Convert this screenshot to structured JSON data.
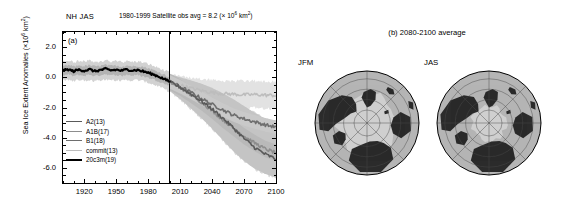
{
  "figure": {
    "panel_a_tag": "(a)",
    "panel_b_title": "(b) 2080-2100 average",
    "header_region_season": "NH JAS",
    "header_obs": "1980-1999 Satellite obs avg = 8.2 (× 10⁶ km²)",
    "header_obs_pre": "1980-1999 Satellite obs avg = 8.2 (× 10",
    "header_obs_sup": "6",
    "header_obs_post": " km",
    "header_obs_sup2": "2",
    "header_obs_close": ")"
  },
  "axes": {
    "ylabel_pre": "Sea Ice Extent Anomalies (×10",
    "ylabel_sup": "6",
    "ylabel_mid": " km",
    "ylabel_sup2": "2",
    "ylabel_post": ")",
    "ylabel_full": "Sea Ice Extent Anomalies (×10⁶ km²)",
    "yticks": [
      "2.0",
      "0.0",
      "-2.0",
      "-4.0",
      "-6.0"
    ],
    "ytick_values": [
      2.0,
      0.0,
      -2.0,
      -4.0,
      -6.0
    ],
    "ylim": [
      -7.0,
      3.0
    ],
    "xticks": [
      "1920",
      "1950",
      "1980",
      "2010",
      "2040",
      "2070",
      "2100"
    ],
    "xtick_values": [
      1920,
      1950,
      1980,
      2010,
      2040,
      2070,
      2100
    ],
    "xlim": [
      1900,
      2100
    ],
    "minor_tick_interval": 10,
    "divider_year": 2000
  },
  "legend": {
    "entries": [
      {
        "label": "A2(13)",
        "color": "#5a5a5a",
        "width": 1.6
      },
      {
        "label": "A1B(17)",
        "color": "#8d8d8d",
        "width": 1.6
      },
      {
        "label": "B1(18)",
        "color": "#6e6e6e",
        "width": 1.6
      },
      {
        "label": "commit(13)",
        "color": "#bdbdbd",
        "width": 1.6
      },
      {
        "label": "20c3m(19)",
        "color": "#000000",
        "width": 2.2
      }
    ]
  },
  "maps": {
    "items": [
      {
        "label": "JFM",
        "name": "map-jfm",
        "ice_extent": 0.93
      },
      {
        "label": "JAS",
        "name": "map-jas",
        "ice_extent": 0.42
      }
    ],
    "land_color": "#2b2b2b",
    "ocean_color": "#b5b5b5",
    "ice_color": "#cfcfcf",
    "graticule_color": "#4a4a4a",
    "circles": [
      0.25,
      0.45,
      0.65,
      0.85,
      1.0
    ]
  },
  "chart_data": {
    "type": "line",
    "xlabel": "",
    "ylabel": "Sea Ice Extent Anomalies (×10⁶ km²)",
    "xlim": [
      1900,
      2100
    ],
    "ylim": [
      -7.0,
      3.0
    ],
    "grid": false,
    "legend_position": "lower-left",
    "annotations": [
      {
        "text": "NH JAS",
        "x": 1903,
        "y": 3.35
      },
      {
        "text": "1980-1999 Satellite obs avg = 8.2 (× 10⁶ km²)",
        "x": 2000,
        "y": 3.35
      },
      {
        "text": "(a)",
        "x": 1906,
        "y": 2.6
      }
    ],
    "vertical_line": {
      "x": 2000,
      "color": "#000000",
      "width": 1
    },
    "series": [
      {
        "name": "20c3m(19)",
        "color": "#000000",
        "width": 2.2,
        "x": [
          1900,
          1905,
          1910,
          1915,
          1920,
          1925,
          1930,
          1935,
          1940,
          1945,
          1950,
          1955,
          1960,
          1965,
          1970,
          1975,
          1980,
          1985,
          1990,
          1995,
          2000
        ],
        "values": [
          0.45,
          0.52,
          0.4,
          0.5,
          0.44,
          0.52,
          0.4,
          0.48,
          0.55,
          0.46,
          0.5,
          0.44,
          0.52,
          0.46,
          0.48,
          0.4,
          0.3,
          0.18,
          0.05,
          -0.12,
          -0.28
        ],
        "band_outer": [
          [
            1.05,
            -0.2
          ],
          [
            1.1,
            -0.15
          ],
          [
            1.0,
            -0.25
          ],
          [
            1.08,
            -0.18
          ],
          [
            1.02,
            -0.22
          ],
          [
            1.1,
            -0.15
          ],
          [
            1.0,
            -0.25
          ],
          [
            1.05,
            -0.18
          ],
          [
            1.12,
            -0.12
          ],
          [
            1.04,
            -0.2
          ],
          [
            1.08,
            -0.18
          ],
          [
            1.0,
            -0.24
          ],
          [
            1.08,
            -0.16
          ],
          [
            1.02,
            -0.22
          ],
          [
            1.05,
            -0.18
          ],
          [
            0.98,
            -0.25
          ],
          [
            0.88,
            -0.35
          ],
          [
            0.75,
            -0.48
          ],
          [
            0.62,
            -0.6
          ],
          [
            0.45,
            -0.78
          ],
          [
            0.3,
            -0.95
          ]
        ],
        "band_inner": [
          [
            0.75,
            0.12
          ],
          [
            0.8,
            0.18
          ],
          [
            0.72,
            0.08
          ],
          [
            0.78,
            0.16
          ],
          [
            0.74,
            0.1
          ],
          [
            0.8,
            0.18
          ],
          [
            0.72,
            0.08
          ],
          [
            0.76,
            0.15
          ],
          [
            0.82,
            0.22
          ],
          [
            0.75,
            0.12
          ],
          [
            0.78,
            0.16
          ],
          [
            0.71,
            0.09
          ],
          [
            0.78,
            0.18
          ],
          [
            0.73,
            0.11
          ],
          [
            0.76,
            0.15
          ],
          [
            0.7,
            0.06
          ],
          [
            0.6,
            -0.02
          ],
          [
            0.48,
            -0.14
          ],
          [
            0.34,
            -0.26
          ],
          [
            0.18,
            -0.42
          ],
          [
            0.02,
            -0.58
          ]
        ]
      },
      {
        "name": "commit(13)",
        "color": "#bdbdbd",
        "width": 1.6,
        "x": [
          2000,
          2010,
          2020,
          2030,
          2040,
          2050,
          2060,
          2070,
          2080,
          2090,
          2100
        ],
        "values": [
          -0.3,
          -0.52,
          -0.72,
          -0.88,
          -1.0,
          -1.08,
          -1.12,
          -1.16,
          -1.14,
          -1.18,
          -1.2
        ],
        "band_outer": [
          [
            0.2,
            -0.85
          ],
          [
            0.05,
            -1.15
          ],
          [
            -0.05,
            -1.45
          ],
          [
            -0.12,
            -1.65
          ],
          [
            -0.18,
            -1.8
          ],
          [
            -0.22,
            -1.92
          ],
          [
            -0.24,
            -2.0
          ],
          [
            -0.26,
            -2.05
          ],
          [
            -0.25,
            -2.04
          ],
          [
            -0.28,
            -2.08
          ],
          [
            -0.3,
            -2.1
          ]
        ]
      },
      {
        "name": "B1(18)",
        "color": "#6e6e6e",
        "width": 1.6,
        "x": [
          2000,
          2010,
          2020,
          2030,
          2040,
          2050,
          2060,
          2070,
          2080,
          2090,
          2100
        ],
        "values": [
          -0.3,
          -0.62,
          -1.0,
          -1.4,
          -1.8,
          -2.15,
          -2.5,
          -2.75,
          -2.95,
          -3.15,
          -3.3
        ]
      },
      {
        "name": "A1B(17)",
        "color": "#8d8d8d",
        "width": 1.6,
        "x": [
          2000,
          2010,
          2020,
          2030,
          2040,
          2050,
          2060,
          2070,
          2080,
          2090,
          2100
        ],
        "values": [
          -0.3,
          -0.68,
          -1.15,
          -1.65,
          -2.2,
          -2.8,
          -3.35,
          -3.9,
          -4.35,
          -4.75,
          -5.0
        ]
      },
      {
        "name": "A2(13)",
        "color": "#5a5a5a",
        "width": 1.6,
        "x": [
          2000,
          2010,
          2020,
          2030,
          2040,
          2050,
          2060,
          2070,
          2080,
          2090,
          2100
        ],
        "values": [
          -0.3,
          -0.66,
          -1.1,
          -1.58,
          -2.1,
          -2.7,
          -3.35,
          -4.05,
          -4.65,
          -5.1,
          -5.42
        ],
        "band_outer": [
          [
            0.22,
            -0.9
          ],
          [
            0.0,
            -1.45
          ],
          [
            -0.2,
            -2.05
          ],
          [
            -0.42,
            -2.7
          ],
          [
            -0.7,
            -3.4
          ],
          [
            -1.05,
            -4.15
          ],
          [
            -1.45,
            -4.9
          ],
          [
            -1.9,
            -5.55
          ],
          [
            -2.35,
            -6.05
          ],
          [
            -2.75,
            -6.4
          ],
          [
            -3.05,
            -6.65
          ]
        ]
      }
    ]
  }
}
